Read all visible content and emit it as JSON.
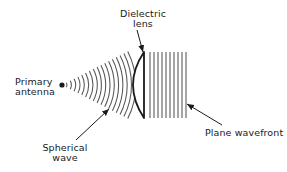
{
  "diagram": {
    "type": "lens-antenna-schematic",
    "labels": {
      "primary_antenna": [
        "Primary",
        "antenna"
      ],
      "dielectric_lens": [
        "Dielectric",
        "lens"
      ],
      "spherical_wave": [
        "Spherical",
        "wave"
      ],
      "plane_wavefront": "Plane wavefront"
    },
    "elements": {
      "source": {
        "name": "primary-antenna-dot",
        "x": 62,
        "y": 85,
        "r": 2.6
      },
      "spherical_arcs": {
        "count": 17,
        "center": [
          62,
          85
        ],
        "first_radius": 5,
        "spacing": 4.3,
        "half_angle_deg": 27
      },
      "lens": {
        "flat_x": 144,
        "top_y": 52,
        "bottom_y": 118,
        "bulge_x": 133
      },
      "plane_lines": {
        "count": 10,
        "start_x": 150,
        "spacing": 4,
        "top_y": 52,
        "bottom_y": 118
      }
    },
    "arrows": [
      {
        "name": "dielectric-lens-arrow",
        "from": [
          137,
          30
        ],
        "to": [
          143,
          52
        ]
      },
      {
        "name": "spherical-wave-arrow",
        "from": [
          76,
          140
        ],
        "to": [
          109,
          109
        ]
      },
      {
        "name": "plane-wavefront-arrow",
        "from": [
          222,
          125
        ],
        "to": [
          187,
          104
        ]
      }
    ],
    "colors": {
      "ink": "#1a1a1a",
      "line": "#555555",
      "background": "#ffffff"
    }
  }
}
